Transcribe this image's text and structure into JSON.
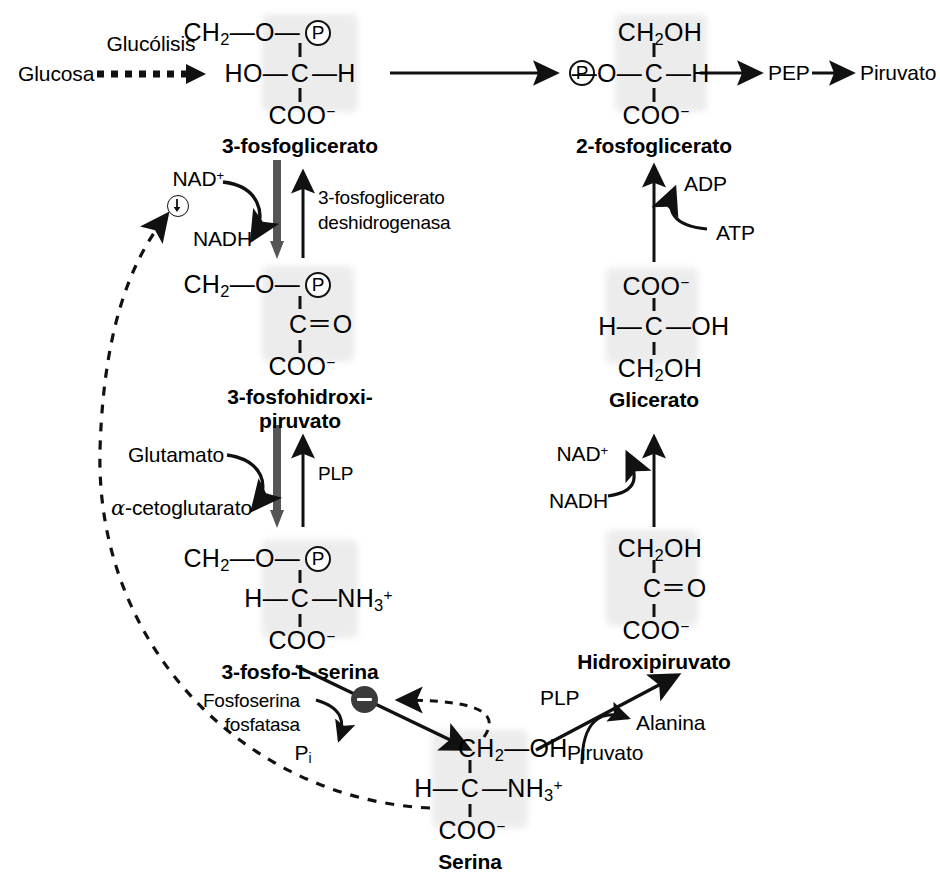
{
  "diagram": {
    "language": "es"
  },
  "metabolites": {
    "glucosa": "Glucosa",
    "pg3_name": "3-fosfoglicerato",
    "pg2_name": "2-fosfoglicerato",
    "pep": "PEP",
    "piruvato_top": "Piruvato",
    "fosfohidroxipiruvato_line1": "3-fosfohidroxi-",
    "fosfohidroxipiruvato_line2": "piruvato",
    "fosfoserina_name": "3-fosfo-L-serina",
    "serina_name": "Serina",
    "glicerato_name": "Glicerato",
    "hidroxipiruvato_name": "Hidroxipiruvato"
  },
  "pathway_labels": {
    "glucolisis": "Glucólisis",
    "enzyme_dehydrogenase_line1": "3-fosfoglicerato",
    "enzyme_dehydrogenase_line2": "deshidrogenasa",
    "plp_transaminase": "PLP",
    "plp_serine_pyruvate": "PLP",
    "phosphatase_line1": "Fosfoserina",
    "phosphatase_line2": "fosfatasa"
  },
  "cofactors": {
    "nad_plus_left": "NAD",
    "nad_plus_left_sup": "+",
    "nadh_left": "NADH",
    "glutamato": "Glutamato",
    "alpha_ketoglutarate_alpha": "α",
    "alpha_ketoglutarate_rest": "-cetoglutarato",
    "pi": "P",
    "pi_sub": "i",
    "alanina": "Alanina",
    "piruvato_bottom": "Piruvato",
    "nad_plus_right": "NAD",
    "nad_plus_right_sup": "+",
    "nadh_right": "NADH",
    "adp": "ADP",
    "atp": "ATP"
  },
  "structures": {
    "pg3": {
      "top": "CH",
      "top_sub": "2",
      "top_tail": "—O—",
      "mid_left": "HO—",
      "mid_c": "C",
      "mid_right": "—H",
      "bottom": "COO",
      "bottom_sup": "−",
      "phosphate": "P"
    },
    "pg2": {
      "top": "CH",
      "top_sub": "2",
      "top_tail": "OH",
      "mid_left": "—O—",
      "mid_c": "C",
      "mid_right": "—H",
      "bottom": "COO",
      "bottom_sup": "−",
      "phosphate": "P"
    },
    "fosfohidroxipiruvato": {
      "top": "CH",
      "top_sub": "2",
      "top_tail": "—O—",
      "mid": "C＝O",
      "bottom": "COO",
      "bottom_sup": "−",
      "phosphate": "P"
    },
    "fosfoserina": {
      "top": "CH",
      "top_sub": "2",
      "top_tail": "—O—",
      "mid_left": "H—",
      "mid_c": "C",
      "mid_right": "—NH",
      "mid_sub": "3",
      "mid_sup": "+",
      "bottom": "COO",
      "bottom_sup": "−",
      "phosphate": "P"
    },
    "serina": {
      "top": "CH",
      "top_sub": "2",
      "top_tail": "—OH",
      "mid_left": "H—",
      "mid_c": "C",
      "mid_right": "—NH",
      "mid_sub": "3",
      "mid_sup": "+",
      "bottom": "COO",
      "bottom_sup": "−"
    },
    "glicerato": {
      "top": "COO",
      "top_sup": "−",
      "mid_left": "H—",
      "mid_c": "C",
      "mid_right": "—OH",
      "bottom": "CH",
      "bottom_sub": "2",
      "bottom_tail": "OH"
    },
    "hidroxipiruvato": {
      "top": "CH",
      "top_sub": "2",
      "top_tail": "OH",
      "mid": "C＝O",
      "bottom": "COO",
      "bottom_sup": "−"
    }
  },
  "icons": {
    "phosphate_circle": "circled-P",
    "down_arrow_circle": "circled-down-arrow",
    "inhibition_circle": "filled-minus-circle"
  },
  "colors": {
    "ink": "#111111",
    "shading": "#e9e9e9",
    "inhibition_fill": "#3a3a3a"
  }
}
